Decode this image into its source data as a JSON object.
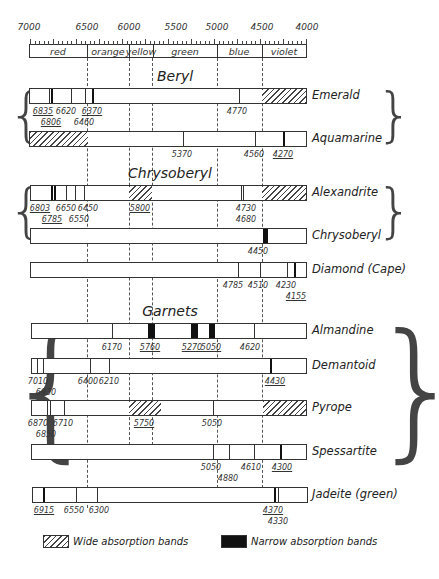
{
  "scale": {
    "unit": "Ångström",
    "ticks": [
      {
        "label": "7000",
        "x": 29
      },
      {
        "label": "6500",
        "x": 87
      },
      {
        "label": "6000",
        "x": 129
      },
      {
        "label": "5500",
        "x": 176
      },
      {
        "label": "5000",
        "x": 217
      },
      {
        "label": "4500",
        "x": 262
      },
      {
        "label": "4000",
        "x": 307
      }
    ],
    "bands": [
      {
        "name": "red",
        "x0": 29,
        "x1": 87
      },
      {
        "name": "orange",
        "x0": 87,
        "x1": 129
      },
      {
        "name": "yellow",
        "x0": 129,
        "x1": 153
      },
      {
        "name": "green",
        "x0": 153,
        "x1": 217
      },
      {
        "name": "blue",
        "x0": 217,
        "x1": 262
      },
      {
        "name": "violet",
        "x0": 262,
        "x1": 307
      }
    ]
  },
  "groups": [
    {
      "title": "Beryl",
      "rows": [
        "Emerald",
        "Aquamarine"
      ]
    },
    {
      "title": "Chrysoberyl",
      "rows": [
        "Alexandrite",
        "Chrysoberyl"
      ]
    },
    {
      "title": "Garnets",
      "rows": [
        "Almandine",
        "Demantoid",
        "Pyrope",
        "Spessartite"
      ]
    }
  ],
  "titles": {
    "beryl": "Beryl",
    "chrysoberyl": "Chrysoberyl",
    "garnets": "Garnets"
  },
  "rows": [
    {
      "name": "Emerald",
      "wide_bands": [
        {
          "x0": 262,
          "x1": 307
        }
      ],
      "narrow_bands": [],
      "lines": [
        48,
        50,
        70,
        84
      ],
      "thick_lines": [
        91
      ],
      "line_219": [
        229
      ],
      "labels": [
        {
          "text": "6835",
          "x": 43,
          "row": 0,
          "underline": true
        },
        {
          "text": "6620",
          "x": 66,
          "row": 0,
          "underline": false
        },
        {
          "text": "6370",
          "x": 92,
          "row": 0,
          "underline": true
        },
        {
          "text": "6806",
          "x": 51,
          "row": 1,
          "underline": true
        },
        {
          "text": "6460",
          "x": 84,
          "row": 1,
          "underline": false
        },
        {
          "text": "4770",
          "x": 237,
          "row": 0,
          "underline": false
        }
      ]
    },
    {
      "name": "Aquamarine",
      "wide_bands": [
        {
          "x0": 29,
          "x1": 87
        }
      ],
      "lines": [
        182,
        254
      ],
      "thick_lines": [
        282
      ],
      "labels": [
        {
          "text": "5370",
          "x": 182,
          "row": 0,
          "underline": false
        },
        {
          "text": "4560",
          "x": 254,
          "row": 0,
          "underline": false
        },
        {
          "text": "4270",
          "x": 283,
          "row": 0,
          "underline": true
        }
      ]
    },
    {
      "name": "Alexandrite",
      "wide_bands": [
        {
          "x0": 129,
          "x1": 152
        },
        {
          "x0": 262,
          "x1": 307
        }
      ],
      "lines": [
        66,
        75,
        84,
        241,
        243
      ],
      "thick_lines": [
        51,
        54
      ],
      "labels": [
        {
          "text": "6803",
          "x": 40,
          "row": 0,
          "underline": true
        },
        {
          "text": "6650",
          "x": 66,
          "row": 0,
          "underline": false
        },
        {
          "text": "6450",
          "x": 88,
          "row": 0,
          "underline": false
        },
        {
          "text": "5800",
          "x": 140,
          "row": 0,
          "underline": true
        },
        {
          "text": "4730",
          "x": 246,
          "row": 0,
          "underline": false
        },
        {
          "text": "6785",
          "x": 52,
          "row": 1,
          "underline": true
        },
        {
          "text": "6550",
          "x": 79,
          "row": 1,
          "underline": false
        },
        {
          "text": "4680",
          "x": 246,
          "row": 1,
          "underline": false
        }
      ]
    },
    {
      "name": "Chrysoberyl",
      "wide_bands": [],
      "narrow_bands": [
        {
          "x0": 262,
          "x1": 267
        }
      ],
      "lines": [],
      "thick_lines": [],
      "labels": [
        {
          "text": "4450",
          "x": 258,
          "row": 0,
          "underline": false
        }
      ]
    },
    {
      "name": "Diamond (Cape)",
      "lines": [
        237,
        259,
        286
      ],
      "thick_lines": [
        293
      ],
      "labels": [
        {
          "text": "4785",
          "x": 233,
          "row": 0,
          "underline": false
        },
        {
          "text": "4510",
          "x": 258,
          "row": 0,
          "underline": false
        },
        {
          "text": "4230",
          "x": 286,
          "row": 0,
          "underline": false
        },
        {
          "text": "4155",
          "x": 296,
          "row": 1,
          "underline": true
        }
      ]
    },
    {
      "name": "Almandine",
      "narrow_bands": [
        {
          "x0": 147,
          "x1": 154
        },
        {
          "x0": 190,
          "x1": 197
        },
        {
          "x0": 208,
          "x1": 214
        }
      ],
      "lines": [
        111,
        253
      ],
      "labels": [
        {
          "text": "6170",
          "x": 112,
          "row": 0,
          "underline": false
        },
        {
          "text": "5760",
          "x": 150,
          "row": 0,
          "underline": true
        },
        {
          "text": "5270",
          "x": 192,
          "row": 0,
          "underline": true
        },
        {
          "text": "5050",
          "x": 211,
          "row": 0,
          "underline": true
        },
        {
          "text": "4620",
          "x": 250,
          "row": 0,
          "underline": false
        }
      ]
    },
    {
      "name": "Demantoid",
      "lines": [
        36,
        42,
        89,
        108
      ],
      "thick_lines": [
        269
      ],
      "labels": [
        {
          "text": "7010",
          "x": 38,
          "row": 0,
          "underline": false
        },
        {
          "text": "6400",
          "x": 88,
          "row": 0,
          "underline": false
        },
        {
          "text": "6210",
          "x": 109,
          "row": 0,
          "underline": false
        },
        {
          "text": "4430",
          "x": 275,
          "row": 0,
          "underline": true
        },
        {
          "text": "6930",
          "x": 46,
          "row": 1,
          "underline": false
        }
      ]
    },
    {
      "name": "Pyrope",
      "wide_bands": [
        {
          "x0": 128,
          "x1": 160
        },
        {
          "x0": 262,
          "x1": 307
        }
      ],
      "lines": [
        46,
        49,
        63,
        212
      ],
      "labels": [
        {
          "text": "6870",
          "x": 38,
          "row": 0,
          "underline": false
        },
        {
          "text": "6710",
          "x": 63,
          "row": 0,
          "underline": false
        },
        {
          "text": "5750",
          "x": 144,
          "row": 0,
          "underline": true
        },
        {
          "text": "5050",
          "x": 212,
          "row": 0,
          "underline": false
        },
        {
          "text": "6850",
          "x": 46,
          "row": 1,
          "underline": false
        }
      ]
    },
    {
      "name": "Spessartite",
      "lines": [
        212,
        228,
        253
      ],
      "thick_lines": [
        279
      ],
      "labels": [
        {
          "text": "5050",
          "x": 211,
          "row": 0,
          "underline": false
        },
        {
          "text": "4610",
          "x": 251,
          "row": 0,
          "underline": false
        },
        {
          "text": "4300",
          "x": 282,
          "row": 0,
          "underline": true
        },
        {
          "text": "4880",
          "x": 228,
          "row": 1,
          "underline": false
        }
      ]
    },
    {
      "name": "Jadeite (green)",
      "lines": [
        75,
        96,
        277
      ],
      "thick_lines": [
        42,
        273
      ],
      "labels": [
        {
          "text": "6915",
          "x": 44,
          "row": 0,
          "underline": true
        },
        {
          "text": "6550",
          "x": 74,
          "row": 0,
          "underline": false
        },
        {
          "text": "6300",
          "x": 99,
          "row": 0,
          "underline": false
        },
        {
          "text": "4370",
          "x": 273,
          "row": 0,
          "underline": true
        },
        {
          "text": "4330",
          "x": 278,
          "row": 1,
          "underline": false
        }
      ]
    }
  ],
  "legend": {
    "wide": "Wide absorption bands",
    "narrow": "Narrow absorption bands"
  }
}
